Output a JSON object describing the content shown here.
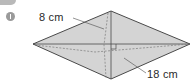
{
  "problem": {
    "number_badge": "1",
    "shape": "rhombus",
    "labels": {
      "short_diagonal": "8 cm",
      "long_diagonal": "18 cm"
    },
    "colors": {
      "fill": "#d4d4d4",
      "outline": "#4a4a4a",
      "dash": "#7a7a7a",
      "badge": "#9a9a9a"
    }
  }
}
